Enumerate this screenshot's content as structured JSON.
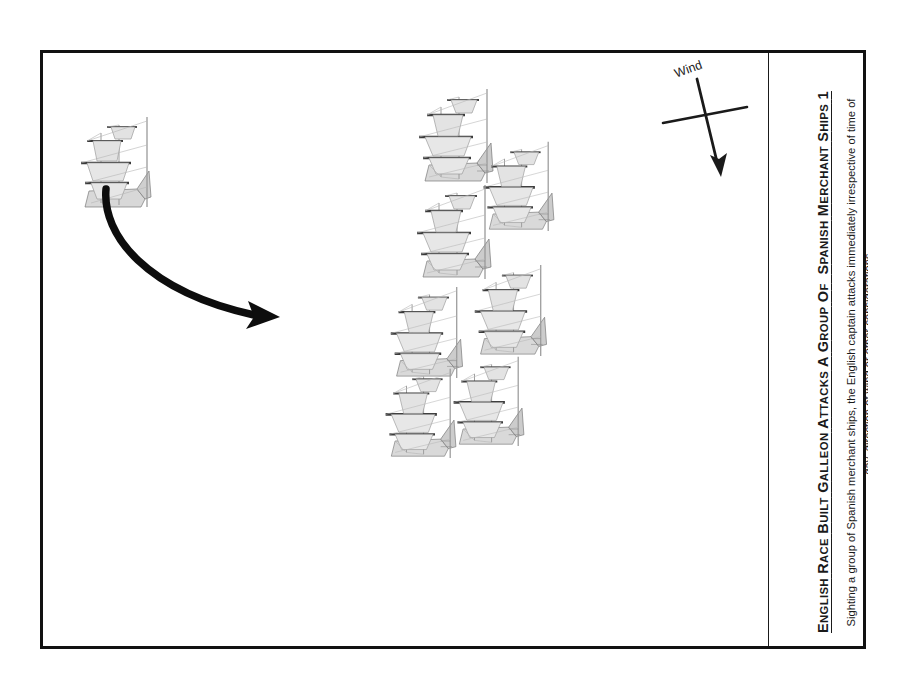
{
  "figure": {
    "background_color": "#ffffff",
    "frame_color": "#111111",
    "ink_color": "#1a1a1a",
    "ship_color": "#8c8c8c",
    "ship_dark_color": "#3a3a3a"
  },
  "caption": {
    "title_full": "ENGLISH RACE BUILT GALLEON ATTACKS A GROUP OF  SPANISH MERCHANT SHIPS 1",
    "title_part_1_cap": "E",
    "title_part_1_rest": "NGLISH",
    "title_part_2_cap": "R",
    "title_part_2_rest": "ACE",
    "title_part_3_cap": "B",
    "title_part_3_rest": "UILT",
    "title_part_4_cap": "G",
    "title_part_4_rest": "ALLEON",
    "title_part_5_cap": "A",
    "title_part_5_rest": "TTACKS",
    "title_part_6_cap": "A",
    "title_part_7_cap": "G",
    "title_part_7_rest": "ROUP",
    "title_part_8_cap": "O",
    "title_part_8_rest": "F",
    "title_part_9_cap": "S",
    "title_part_9_rest": "PANISH",
    "title_part_10_cap": "M",
    "title_part_10_rest": "ERCHANT",
    "title_part_11_cap": "S",
    "title_part_11_rest": "HIPS",
    "title_number": "1",
    "body": "Sighting a group of Spanish merchant ships, the English captain attacks immediately irrespective of time of day, direction of wind or other considerations."
  },
  "wind": {
    "label": "Wind",
    "arrow_direction": "down",
    "cross_rotation_deg": -20
  },
  "scene": {
    "english_ship": {
      "name": "English race built galleon",
      "heading": "east",
      "x": 28,
      "y": 58
    },
    "attack_arrow": {
      "name": "attack-course-arrow",
      "from_x": 60,
      "from_y": 140,
      "to_x": 235,
      "to_y": 240
    },
    "merchant_ships": [
      {
        "id": 1,
        "x": 368,
        "y": 32,
        "scale": 1.0
      },
      {
        "id": 2,
        "x": 433,
        "y": 85,
        "scale": 0.95
      },
      {
        "id": 3,
        "x": 366,
        "y": 128,
        "scale": 1.0
      },
      {
        "id": 4,
        "x": 424,
        "y": 208,
        "scale": 0.97
      },
      {
        "id": 5,
        "x": 340,
        "y": 230,
        "scale": 0.97
      },
      {
        "id": 6,
        "x": 403,
        "y": 300,
        "scale": 0.95
      },
      {
        "id": 7,
        "x": 335,
        "y": 312,
        "scale": 0.95
      }
    ],
    "merchant_ship_count": 7
  }
}
